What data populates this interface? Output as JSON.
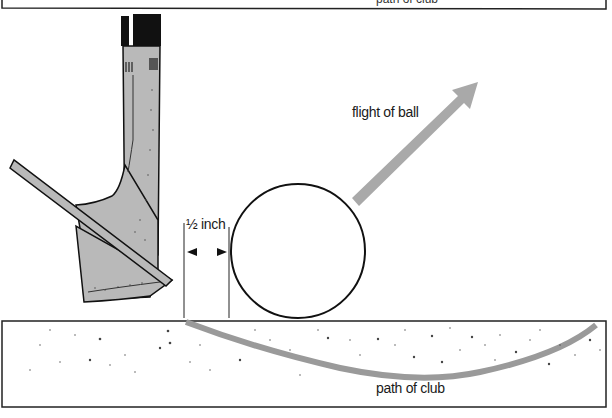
{
  "diagram": {
    "top_box": {
      "label": "path of club"
    },
    "labels": {
      "distance": "½ inch",
      "flight": "flight of ball",
      "path": "path of club"
    },
    "colors": {
      "outline": "#111111",
      "club_fill": "#b9b9b9",
      "arrow_fill": "#a9a9a9",
      "path_stroke": "#9a9a9a",
      "grip": "#111111",
      "background": "#ffffff"
    },
    "elements": {
      "club": "sand wedge head with shaft, shown from face side",
      "ball": "golf ball resting on sand surface",
      "distance_marker": "two vertical guide lines with arrows showing ½ inch gap between club entry and ball",
      "flight_arrow": "gray arrow pointing up-right",
      "sand": "speckled sand box with curved club path"
    }
  }
}
